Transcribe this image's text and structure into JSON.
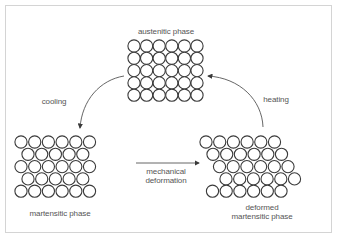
{
  "diagram": {
    "phases": {
      "austenitic": {
        "label": "austenitic phase",
        "rows": 5,
        "cols": 6,
        "lattice": "square"
      },
      "martensitic": {
        "label": "martensitic phase",
        "rows": 5,
        "lattice": "twinned/offset"
      },
      "deformed": {
        "label_line1": "deformed",
        "label_line2": "martensitic phase",
        "rows": 5,
        "cols": 6,
        "lattice": "sheared"
      }
    },
    "transitions": {
      "cooling": {
        "label": "cooling",
        "from": "austenitic phase",
        "to": "martensitic phase"
      },
      "deformation": {
        "label_line1": "mechanical",
        "label_line2": "deformation",
        "from": "martensitic phase",
        "to": "deformed martensitic phase"
      },
      "heating": {
        "label": "heating",
        "from": "deformed martensitic phase",
        "to": "austenitic phase"
      }
    },
    "colors": {
      "stroke": "#3a3a3a",
      "text": "#555555",
      "frame": "#d4d4d4"
    }
  }
}
